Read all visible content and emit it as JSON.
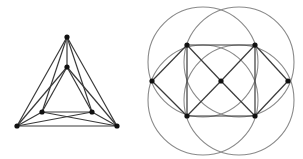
{
  "colors": {
    "background": "#ffffff",
    "edge": "#3a3a3a",
    "circle": "#8a8a8a",
    "node": "#111111"
  },
  "graphs": [
    {
      "id": "nested-triangles",
      "nodes": [
        {
          "id": "outer-top",
          "x": 67,
          "y": 37
        },
        {
          "id": "outer-left",
          "x": 17,
          "y": 126
        },
        {
          "id": "outer-right",
          "x": 117,
          "y": 126
        },
        {
          "id": "inner-top",
          "x": 67,
          "y": 67
        },
        {
          "id": "inner-left",
          "x": 42,
          "y": 112
        },
        {
          "id": "inner-right",
          "x": 92,
          "y": 112
        }
      ],
      "edges": [
        [
          "outer-top",
          "outer-left"
        ],
        [
          "outer-top",
          "outer-right"
        ],
        [
          "outer-left",
          "outer-right"
        ],
        [
          "inner-top",
          "inner-left"
        ],
        [
          "inner-top",
          "inner-right"
        ],
        [
          "inner-left",
          "inner-right"
        ],
        [
          "outer-top",
          "inner-top"
        ],
        [
          "outer-top",
          "inner-left"
        ],
        [
          "outer-top",
          "inner-right"
        ],
        [
          "outer-left",
          "inner-top"
        ],
        [
          "outer-left",
          "inner-left"
        ],
        [
          "outer-left",
          "inner-right"
        ],
        [
          "outer-right",
          "inner-top"
        ],
        [
          "outer-right",
          "inner-left"
        ],
        [
          "outer-right",
          "inner-right"
        ]
      ],
      "circles": []
    },
    {
      "id": "square-with-circles",
      "nodes": [
        {
          "id": "top-left",
          "x": 187,
          "y": 45
        },
        {
          "id": "top-right",
          "x": 255,
          "y": 45
        },
        {
          "id": "bottom-left",
          "x": 187,
          "y": 116
        },
        {
          "id": "bottom-right",
          "x": 255,
          "y": 116
        },
        {
          "id": "center",
          "x": 221,
          "y": 81
        },
        {
          "id": "left",
          "x": 152,
          "y": 81
        },
        {
          "id": "right",
          "x": 288,
          "y": 81
        }
      ],
      "edges": [
        [
          "top-left",
          "top-right"
        ],
        [
          "top-right",
          "bottom-right"
        ],
        [
          "bottom-right",
          "bottom-left"
        ],
        [
          "bottom-left",
          "top-left"
        ],
        [
          "top-left",
          "center"
        ],
        [
          "top-right",
          "center"
        ],
        [
          "bottom-left",
          "center"
        ],
        [
          "bottom-right",
          "center"
        ],
        [
          "left",
          "top-left"
        ],
        [
          "left",
          "bottom-left"
        ],
        [
          "right",
          "top-right"
        ],
        [
          "right",
          "bottom-right"
        ]
      ],
      "circles": [
        {
          "id": "upper-left-circle",
          "cx": 203,
          "cy": 62,
          "r": 55
        },
        {
          "id": "upper-right-circle",
          "cx": 239,
          "cy": 62,
          "r": 55
        },
        {
          "id": "lower-left-circle",
          "cx": 203,
          "cy": 100,
          "r": 55
        },
        {
          "id": "lower-right-circle",
          "cx": 239,
          "cy": 100,
          "r": 55
        }
      ]
    }
  ]
}
